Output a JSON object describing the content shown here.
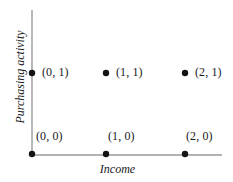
{
  "figure": {
    "width": 233,
    "height": 182,
    "background": "#ffffff"
  },
  "axes": {
    "x_title": "Income",
    "y_title": "Purchasing activity",
    "line_color": "#9a9a9a",
    "x_axis": {
      "x1": 32,
      "y1": 155,
      "x2": 222,
      "y2": 155
    },
    "y_axis": {
      "x1": 32,
      "y1": 10,
      "x2": 32,
      "y2": 155
    }
  },
  "points": [
    {
      "name": "point-0-0",
      "label": "(0, 0)",
      "x": 0,
      "y": 0,
      "px": 32,
      "py": 154,
      "label_px": 36,
      "label_py": 130
    },
    {
      "name": "point-1-0",
      "label": "(1, 0)",
      "x": 1,
      "y": 0,
      "px": 106,
      "py": 154,
      "label_px": 108,
      "label_py": 130
    },
    {
      "name": "point-2-0",
      "label": "(2, 0)",
      "x": 2,
      "y": 0,
      "px": 185,
      "py": 154,
      "label_px": 186,
      "label_py": 130
    },
    {
      "name": "point-0-1",
      "label": "(0, 1)",
      "x": 0,
      "y": 1,
      "px": 32,
      "py": 73,
      "label_px": 42,
      "label_py": 66
    },
    {
      "name": "point-1-1",
      "label": "(1, 1)",
      "x": 1,
      "y": 1,
      "px": 106,
      "py": 73,
      "label_px": 116,
      "label_py": 66
    },
    {
      "name": "point-2-1",
      "label": "(2, 1)",
      "x": 2,
      "y": 1,
      "px": 185,
      "py": 73,
      "label_px": 195,
      "label_py": 66
    }
  ],
  "marker": {
    "color": "#141414",
    "radius": 3.2
  },
  "chart_data": {
    "type": "scatter",
    "title": "",
    "xlabel": "Income",
    "ylabel": "Purchasing activity",
    "x": [
      0,
      1,
      2,
      0,
      1,
      2
    ],
    "y": [
      0,
      0,
      0,
      1,
      1,
      1
    ],
    "point_labels": [
      "(0, 0)",
      "(1, 0)",
      "(2, 0)",
      "(0, 1)",
      "(1, 1)",
      "(2, 1)"
    ],
    "series": [
      {
        "name": "states",
        "points": [
          {
            "x": 0,
            "y": 0,
            "label": "(0, 0)"
          },
          {
            "x": 1,
            "y": 0,
            "label": "(1, 0)"
          },
          {
            "x": 2,
            "y": 0,
            "label": "(2, 0)"
          },
          {
            "x": 0,
            "y": 1,
            "label": "(0, 1)"
          },
          {
            "x": 1,
            "y": 1,
            "label": "(1, 1)"
          },
          {
            "x": 2,
            "y": 1,
            "label": "(2, 1)"
          }
        ]
      }
    ],
    "xlim": [
      0,
      2.4
    ],
    "ylim": [
      0,
      1.8
    ],
    "xticks": [],
    "yticks": [],
    "grid": false,
    "legend": false,
    "legend_position": "none",
    "marker_color": "#141414",
    "axis_color": "#9a9a9a"
  }
}
